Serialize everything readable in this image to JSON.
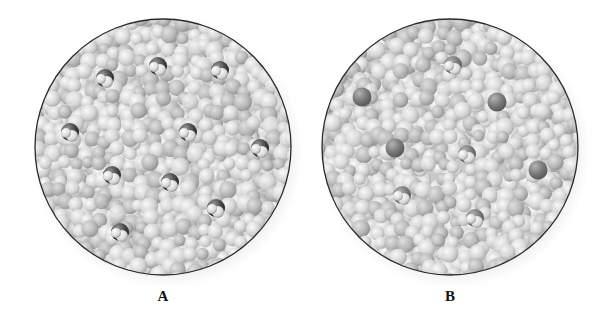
{
  "figure": {
    "panels": [
      {
        "id": "A",
        "label": "A",
        "center": [
          163,
          147
        ],
        "radius": 128,
        "solute_molecules": [
          {
            "x": 105,
            "y": 78,
            "type": "polyatomic"
          },
          {
            "x": 158,
            "y": 66,
            "type": "polyatomic"
          },
          {
            "x": 220,
            "y": 70,
            "type": "polyatomic"
          },
          {
            "x": 70,
            "y": 132,
            "type": "polyatomic"
          },
          {
            "x": 188,
            "y": 132,
            "type": "polyatomic"
          },
          {
            "x": 260,
            "y": 148,
            "type": "polyatomic"
          },
          {
            "x": 112,
            "y": 175,
            "type": "polyatomic"
          },
          {
            "x": 170,
            "y": 182,
            "type": "polyatomic"
          },
          {
            "x": 216,
            "y": 208,
            "type": "polyatomic"
          },
          {
            "x": 120,
            "y": 232,
            "type": "polyatomic"
          }
        ]
      },
      {
        "id": "B",
        "label": "B",
        "center": [
          450,
          147
        ],
        "radius": 128,
        "solute_molecules": [
          {
            "x": 453,
            "y": 65,
            "type": "polyatomic"
          },
          {
            "x": 362,
            "y": 97,
            "type": "single"
          },
          {
            "x": 497,
            "y": 102,
            "type": "single"
          },
          {
            "x": 395,
            "y": 148,
            "type": "single"
          },
          {
            "x": 467,
            "y": 154,
            "type": "polyatomic"
          },
          {
            "x": 538,
            "y": 170,
            "type": "single"
          },
          {
            "x": 402,
            "y": 195,
            "type": "polyatomic"
          },
          {
            "x": 475,
            "y": 218,
            "type": "polyatomic"
          }
        ]
      }
    ],
    "colors": {
      "background": "#ffffff",
      "circle_outline": "#2a2a2a",
      "solvent_light": "#e6e6e6",
      "solvent_mid": "#bdbdbd",
      "solute_dark": "#3a3a3a",
      "solute_mid": "#7a7a7a"
    }
  }
}
